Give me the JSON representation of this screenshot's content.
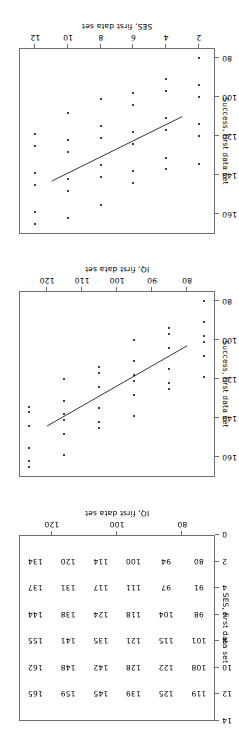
{
  "figure": {
    "panel_count": 3,
    "orientation": "landscape-rotated-180"
  },
  "chart_data": [
    {
      "id": "ses_success",
      "type": "scatter",
      "title": "",
      "xlabel": "SES, first data set",
      "ylabel": "Success, first data set",
      "xlim": [
        1,
        13
      ],
      "ylim": [
        75,
        170
      ],
      "xticks": [
        2,
        4,
        6,
        8,
        10,
        12
      ],
      "yticks": [
        80,
        100,
        120,
        140,
        160
      ],
      "grid": false,
      "legend": "none",
      "points": [
        {
          "x": 2,
          "y": 80
        },
        {
          "x": 2,
          "y": 94
        },
        {
          "x": 2,
          "y": 100
        },
        {
          "x": 2,
          "y": 114
        },
        {
          "x": 2,
          "y": 120
        },
        {
          "x": 2,
          "y": 134
        },
        {
          "x": 4,
          "y": 91
        },
        {
          "x": 4,
          "y": 97
        },
        {
          "x": 4,
          "y": 111
        },
        {
          "x": 4,
          "y": 117
        },
        {
          "x": 4,
          "y": 131
        },
        {
          "x": 4,
          "y": 137
        },
        {
          "x": 6,
          "y": 98
        },
        {
          "x": 6,
          "y": 104
        },
        {
          "x": 6,
          "y": 118
        },
        {
          "x": 6,
          "y": 124
        },
        {
          "x": 6,
          "y": 138
        },
        {
          "x": 6,
          "y": 144
        },
        {
          "x": 8,
          "y": 101
        },
        {
          "x": 8,
          "y": 115
        },
        {
          "x": 8,
          "y": 121
        },
        {
          "x": 8,
          "y": 135
        },
        {
          "x": 8,
          "y": 141
        },
        {
          "x": 8,
          "y": 155
        },
        {
          "x": 10,
          "y": 108
        },
        {
          "x": 10,
          "y": 122
        },
        {
          "x": 10,
          "y": 128
        },
        {
          "x": 10,
          "y": 142
        },
        {
          "x": 10,
          "y": 148
        },
        {
          "x": 10,
          "y": 162
        },
        {
          "x": 12,
          "y": 119
        },
        {
          "x": 12,
          "y": 125
        },
        {
          "x": 12,
          "y": 139
        },
        {
          "x": 12,
          "y": 145
        },
        {
          "x": 12,
          "y": 159
        },
        {
          "x": 12,
          "y": 165
        }
      ],
      "fit_line": {
        "x1": 3,
        "y1": 110,
        "x2": 11,
        "y2": 143
      }
    },
    {
      "id": "iq_success",
      "type": "scatter",
      "title": "",
      "xlabel": "IQ, first data set",
      "ylabel": "Success, first data set",
      "xlim": [
        72,
        128
      ],
      "ylim": [
        75,
        170
      ],
      "xticks": [
        80,
        90,
        100,
        110,
        120
      ],
      "yticks": [
        80,
        100,
        120,
        140,
        160
      ],
      "grid": false,
      "legend": "none",
      "points": [
        {
          "x": 75,
          "y": 80
        },
        {
          "x": 75,
          "y": 91
        },
        {
          "x": 75,
          "y": 98
        },
        {
          "x": 75,
          "y": 101
        },
        {
          "x": 75,
          "y": 108
        },
        {
          "x": 75,
          "y": 119
        },
        {
          "x": 85,
          "y": 94
        },
        {
          "x": 85,
          "y": 97
        },
        {
          "x": 85,
          "y": 104
        },
        {
          "x": 85,
          "y": 115
        },
        {
          "x": 85,
          "y": 122
        },
        {
          "x": 85,
          "y": 125
        },
        {
          "x": 95,
          "y": 100
        },
        {
          "x": 95,
          "y": 111
        },
        {
          "x": 95,
          "y": 118
        },
        {
          "x": 95,
          "y": 121
        },
        {
          "x": 95,
          "y": 128
        },
        {
          "x": 95,
          "y": 139
        },
        {
          "x": 105,
          "y": 114
        },
        {
          "x": 105,
          "y": 117
        },
        {
          "x": 105,
          "y": 124
        },
        {
          "x": 105,
          "y": 135
        },
        {
          "x": 105,
          "y": 142
        },
        {
          "x": 105,
          "y": 145
        },
        {
          "x": 115,
          "y": 120
        },
        {
          "x": 115,
          "y": 131
        },
        {
          "x": 115,
          "y": 138
        },
        {
          "x": 115,
          "y": 141
        },
        {
          "x": 115,
          "y": 148
        },
        {
          "x": 115,
          "y": 159
        },
        {
          "x": 125,
          "y": 134
        },
        {
          "x": 125,
          "y": 137
        },
        {
          "x": 125,
          "y": 144
        },
        {
          "x": 125,
          "y": 155
        },
        {
          "x": 125,
          "y": 162
        },
        {
          "x": 125,
          "y": 165
        }
      ],
      "fit_line": {
        "x1": 80,
        "y1": 103,
        "x2": 120,
        "y2": 144
      }
    },
    {
      "id": "success_value_grid",
      "type": "table",
      "title": "",
      "xlabel": "IQ, first data set",
      "ylabel": "SES, first data set",
      "xlim": [
        70,
        130
      ],
      "ylim": [
        0,
        14
      ],
      "xticks": [
        80,
        100,
        120
      ],
      "yticks": [
        0,
        2,
        4,
        6,
        8,
        10,
        12,
        14
      ],
      "grid": false,
      "legend": "none",
      "col_values_iq": [
        75,
        85,
        95,
        105,
        115,
        125
      ],
      "row_values_ses": [
        2,
        4,
        6,
        8,
        10,
        12
      ],
      "cells": [
        {
          "iq": 75,
          "ses": 2,
          "value": 80
        },
        {
          "iq": 85,
          "ses": 2,
          "value": 94
        },
        {
          "iq": 95,
          "ses": 2,
          "value": 100
        },
        {
          "iq": 105,
          "ses": 2,
          "value": 114
        },
        {
          "iq": 115,
          "ses": 2,
          "value": 120
        },
        {
          "iq": 125,
          "ses": 2,
          "value": 134
        },
        {
          "iq": 75,
          "ses": 4,
          "value": 91
        },
        {
          "iq": 85,
          "ses": 4,
          "value": 97
        },
        {
          "iq": 95,
          "ses": 4,
          "value": 111
        },
        {
          "iq": 105,
          "ses": 4,
          "value": 117
        },
        {
          "iq": 115,
          "ses": 4,
          "value": 131
        },
        {
          "iq": 125,
          "ses": 4,
          "value": 137
        },
        {
          "iq": 75,
          "ses": 6,
          "value": 98
        },
        {
          "iq": 85,
          "ses": 6,
          "value": 104
        },
        {
          "iq": 95,
          "ses": 6,
          "value": 118
        },
        {
          "iq": 105,
          "ses": 6,
          "value": 124
        },
        {
          "iq": 115,
          "ses": 6,
          "value": 138
        },
        {
          "iq": 125,
          "ses": 6,
          "value": 144
        },
        {
          "iq": 75,
          "ses": 8,
          "value": 101
        },
        {
          "iq": 85,
          "ses": 8,
          "value": 115
        },
        {
          "iq": 95,
          "ses": 8,
          "value": 121
        },
        {
          "iq": 105,
          "ses": 8,
          "value": 135
        },
        {
          "iq": 115,
          "ses": 8,
          "value": 141
        },
        {
          "iq": 125,
          "ses": 8,
          "value": 155
        },
        {
          "iq": 75,
          "ses": 10,
          "value": 108
        },
        {
          "iq": 85,
          "ses": 10,
          "value": 122
        },
        {
          "iq": 95,
          "ses": 10,
          "value": 128
        },
        {
          "iq": 105,
          "ses": 10,
          "value": 142
        },
        {
          "iq": 115,
          "ses": 10,
          "value": 148
        },
        {
          "iq": 125,
          "ses": 10,
          "value": 162
        },
        {
          "iq": 75,
          "ses": 12,
          "value": 119
        },
        {
          "iq": 85,
          "ses": 12,
          "value": 125
        },
        {
          "iq": 95,
          "ses": 12,
          "value": 139
        },
        {
          "iq": 105,
          "ses": 12,
          "value": 145
        },
        {
          "iq": 115,
          "ses": 12,
          "value": 159
        },
        {
          "iq": 125,
          "ses": 12,
          "value": 165
        }
      ]
    }
  ]
}
